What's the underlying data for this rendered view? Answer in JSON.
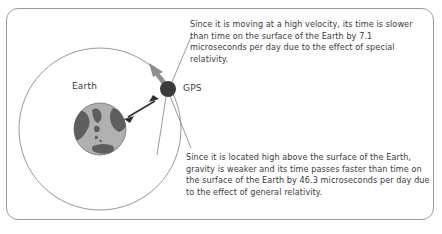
{
  "figure": {
    "border_color": "#9a9a9a",
    "background_color": "#ffffff"
  },
  "labels": {
    "earth": "Earth",
    "gps": "GPS"
  },
  "callouts": {
    "special_relativity": "Since it is moving at a high velocity, its time is slower than time on the surface of the Earth by 7.1 microseconds per day due to the effect of special relativity.",
    "general_relativity": "Since it is located high above the surface of the Earth, gravity is weaker and its time passes faster than time on the surface of the Earth by 46.3 microseconds per day due to the effect of general relativity."
  },
  "values": {
    "special_relativity_offset": "7.1 microseconds per day",
    "general_relativity_offset": "46.3 microseconds per day"
  },
  "colors": {
    "text": "#3b3b3b",
    "orbit_line": "#8c8c8c",
    "leader_line": "#8c8c8c",
    "earth_ocean": "#b0b0b0",
    "earth_land": "#5e5e5e",
    "satellite_body": "#3a3a3a",
    "velocity_arrow": "#8f8f8f",
    "altitude_arrow": "#2e2e2e"
  },
  "geometry": {
    "orbit_center_x": 100,
    "orbit_center_y": 129,
    "orbit_radius": 81,
    "earth_center_x": 100,
    "earth_center_y": 129,
    "earth_radius": 26,
    "satellite_center_x": 168,
    "satellite_center_y": 89,
    "satellite_radius": 8
  }
}
